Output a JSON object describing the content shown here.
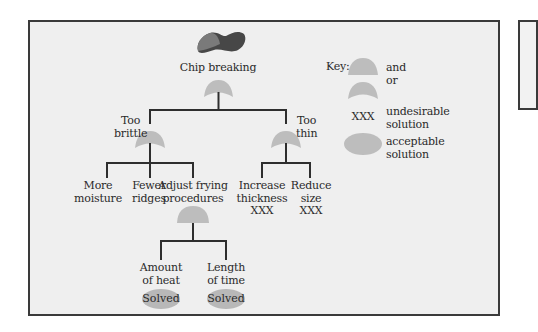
{
  "diagram": {
    "root": {
      "label": "Chip breaking",
      "gate": "or",
      "icon": "potato-chip-icon"
    },
    "branches": [
      {
        "label_lines": [
          "Too",
          "brittle"
        ],
        "gate": "or",
        "children": [
          {
            "label_lines": [
              "More",
              "moisture"
            ]
          },
          {
            "label_lines": [
              "Fewer",
              "ridges"
            ]
          },
          {
            "label_lines": [
              "Adjust frying",
              "procedures"
            ],
            "gate": "and",
            "children": [
              {
                "label_lines": [
                  "Amount",
                  "of heat"
                ],
                "status": "Solved"
              },
              {
                "label_lines": [
                  "Length",
                  "of time"
                ],
                "status": "Solved"
              }
            ]
          }
        ]
      },
      {
        "label_lines": [
          "Too",
          "thin"
        ],
        "gate": "or",
        "children": [
          {
            "label_lines": [
              "Increase",
              "thickness"
            ],
            "mark": "XXX"
          },
          {
            "label_lines": [
              "Reduce",
              "size"
            ],
            "mark": "XXX"
          }
        ]
      }
    ]
  },
  "key": {
    "title": "Key:",
    "items": [
      {
        "symbol": "and-gate",
        "label": "and"
      },
      {
        "symbol": "or-gate",
        "label": "or"
      },
      {
        "symbol": "XXX",
        "label_lines": [
          "undesirable",
          "solution"
        ]
      },
      {
        "symbol": "ellipse",
        "label_lines": [
          "acceptable",
          "solution"
        ]
      }
    ]
  },
  "colors": {
    "frame_border": "#3a3a3a",
    "frame_bg": "#efefef",
    "gate_fill": "#bdbdbd",
    "line": "#2e2e2e",
    "chip_dark": "#4a4a4a",
    "chip_light": "#7a7a7a"
  }
}
